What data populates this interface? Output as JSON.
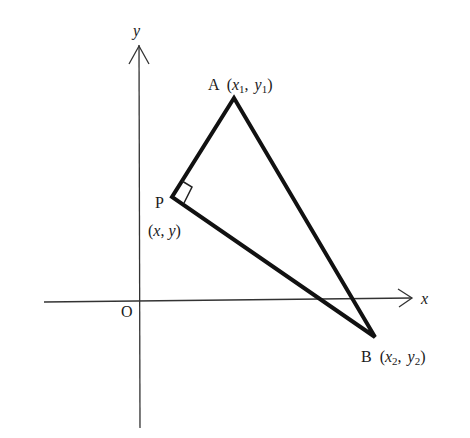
{
  "diagram": {
    "title": "",
    "axes": {
      "x_label": "x",
      "y_label": "y",
      "origin_label": "O"
    },
    "points": {
      "A": {
        "name": "A",
        "coord_label": "(x1, y1)",
        "x_var": "x",
        "x_sub": "1",
        "y_var": "y",
        "y_sub": "1"
      },
      "P": {
        "name": "P",
        "coord_label": "(x, y)",
        "x_var": "x",
        "y_var": "y"
      },
      "B": {
        "name": "B",
        "coord_label": "(x2, y2)",
        "x_var": "x",
        "x_sub": "2",
        "y_var": "y",
        "y_sub": "2"
      }
    },
    "annotations": [
      "right angle at P"
    ],
    "colors": {
      "ink": "#1a1a1a",
      "background": "#ffffff"
    }
  }
}
